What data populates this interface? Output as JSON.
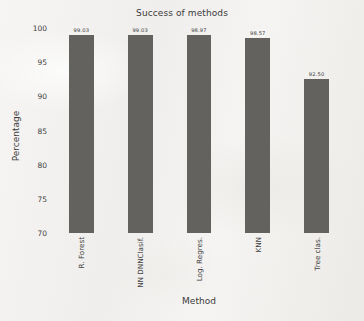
{
  "chart_data": {
    "type": "bar",
    "title": "Success of methods",
    "xlabel": "Method",
    "ylabel": "Percentage",
    "categories": [
      "R. Forest",
      "NN DNNClasif.",
      "Log. Regres.",
      "KNN",
      "Tree clas."
    ],
    "values": [
      99.03,
      99.03,
      98.97,
      98.57,
      92.5
    ],
    "value_labels": [
      "99.03",
      "99.03",
      "98.97",
      "98.57",
      "92.50"
    ],
    "ylim": [
      70,
      100
    ],
    "yticks": [
      100,
      95,
      90,
      85,
      80,
      75,
      70
    ],
    "ytick_labels": [
      "100",
      "95",
      "90",
      "85",
      "80",
      "75",
      "70"
    ],
    "grid": false,
    "legend": false,
    "bar_color": "#63625f",
    "background_color": "#f4f3f1",
    "text_color": "#3b3b3b"
  }
}
